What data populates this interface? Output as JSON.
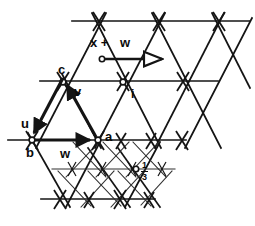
{
  "figure": {
    "type": "lattice-vector-diagram",
    "background_color": "#ffffff",
    "line_color": "#141414",
    "thin_line_color": "#2a2a2a",
    "labels": {
      "x_plus": "x +",
      "w_top": "w",
      "c": "c",
      "v": "v",
      "u": "u",
      "b": "b",
      "a": "a",
      "w_bottom": "w",
      "i": "i",
      "frac_num": "1",
      "frac_den": "3"
    },
    "vectors": [
      {
        "name": "u",
        "from": [
          63,
          82
        ],
        "to": [
          32,
          140
        ],
        "style": "solid-filled-arrow"
      },
      {
        "name": "v",
        "from": [
          98,
          140
        ],
        "to": [
          67,
          84
        ],
        "style": "solid-filled-arrow"
      },
      {
        "name": "w",
        "from": [
          32,
          140
        ],
        "to": [
          96,
          140
        ],
        "style": "solid-filled-arrow"
      },
      {
        "name": "x+w",
        "from": [
          102,
          59
        ],
        "to": [
          170,
          59
        ],
        "style": "open-circle-hollow-arrow"
      }
    ],
    "lattice_points": [
      "a",
      "b",
      "c",
      "i"
    ],
    "sublattice_marker": "1/3"
  }
}
